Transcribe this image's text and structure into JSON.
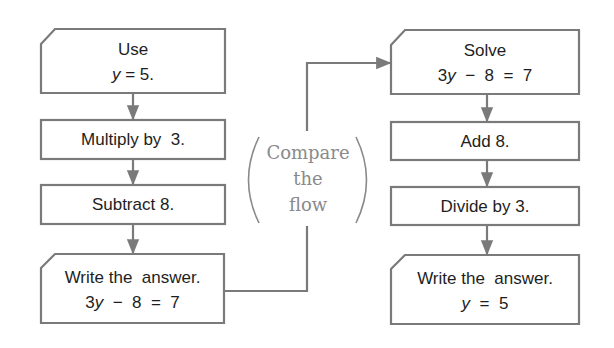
{
  "colors": {
    "stroke": "#7a7a7a",
    "text": "#1e1e1e",
    "annotation": "#8a8a8a",
    "background": "#ffffff"
  },
  "left_flow": {
    "start": {
      "line1": "Use",
      "line2_var": "y",
      "line2_rest": " = 5."
    },
    "step1": {
      "label": "Multiply by  3."
    },
    "step2": {
      "label": "Subtract 8."
    },
    "end": {
      "line1": "Write the  answer.",
      "line2_pre": "3",
      "line2_var": "y",
      "line2_rest": "  −  8  =  7"
    }
  },
  "right_flow": {
    "start": {
      "line1": "Solve",
      "line2_pre": "3",
      "line2_var": "y",
      "line2_rest": "  −  8  =  7"
    },
    "step1": {
      "label": "Add 8."
    },
    "step2": {
      "label": "Divide by 3."
    },
    "end": {
      "line1": "Write the  answer.",
      "line2_var": "y",
      "line2_rest": "  =  5"
    }
  },
  "annotation": {
    "line1": "Compare",
    "line2": "the",
    "line3": "flow"
  },
  "icons": {
    "arrow": "arrowhead-down",
    "connector_arrow": "arrowhead-right",
    "parentheses": "paren-left / paren-right"
  }
}
